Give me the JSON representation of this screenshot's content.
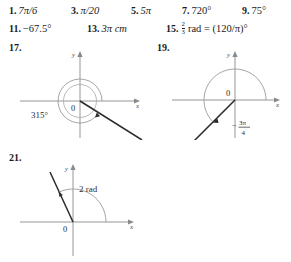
{
  "answers": {
    "row1": [
      {
        "number": "1.",
        "value": "7π/6"
      },
      {
        "number": "3.",
        "value": "π/20"
      },
      {
        "number": "5.",
        "value": "5π"
      },
      {
        "number": "7.",
        "value": "720°"
      },
      {
        "number": "9.",
        "value": "75°"
      }
    ],
    "row2": [
      {
        "number": "11.",
        "value": "−67.5°"
      },
      {
        "number": "13.",
        "value": "3π cm"
      },
      {
        "number": "15.",
        "value": "rad = (120/π)°",
        "fraction_numerator": "2",
        "fraction_denominator": "3"
      }
    ]
  },
  "figures": [
    {
      "id": "17",
      "number": "17.",
      "angle_label": "315°",
      "x_axis_label": "x",
      "y_axis_label": "y",
      "origin_label": "0",
      "terminal_angle_degrees": -45,
      "arc_direction": "clockwise",
      "has_reference_circle": true
    },
    {
      "id": "19",
      "number": "19.",
      "angle_label": "−3π/4",
      "angle_label_prefix": "−",
      "angle_numerator": "3π",
      "angle_denominator": "4",
      "x_axis_label": "x",
      "y_axis_label": "y",
      "origin_label": "0",
      "terminal_angle_degrees": -135,
      "arc_direction": "clockwise",
      "has_reference_circle": false
    },
    {
      "id": "21",
      "number": "21.",
      "angle_label": "2 rad",
      "x_axis_label": "x",
      "y_axis_label": "y",
      "origin_label": "0",
      "terminal_angle_degrees": 114.6,
      "arc_direction": "counterclockwise",
      "has_reference_circle": false
    }
  ],
  "colors": {
    "ink": "#1b1b1b",
    "axis": "#7a7a7a",
    "ray": "#2b2b2b",
    "arc": "#8a8a8a",
    "circle": "#a8a8a8",
    "background": "#ffffff"
  }
}
